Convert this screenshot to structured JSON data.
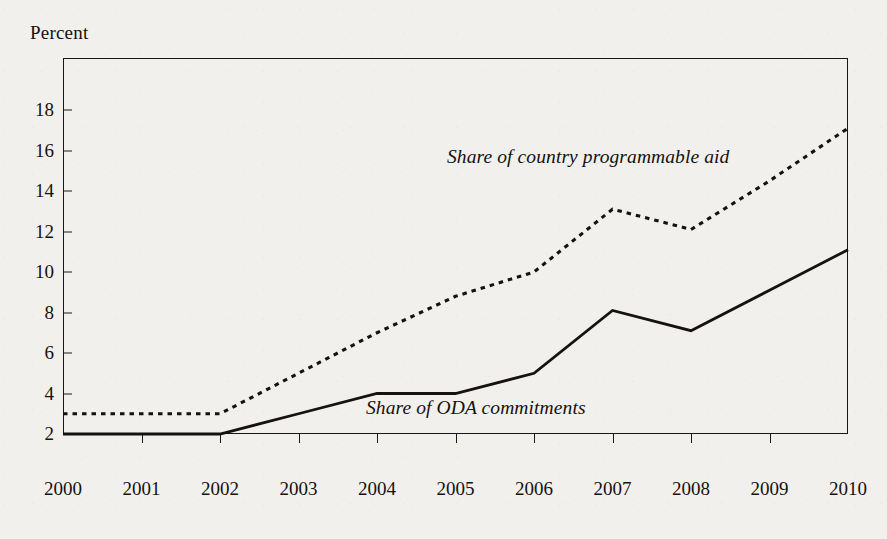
{
  "chart_data": {
    "type": "line",
    "title": "",
    "xlabel": "",
    "ylabel": "Percent",
    "ylim": [
      0,
      19.6
    ],
    "xlim": [
      2000,
      2010
    ],
    "grid": false,
    "legend_position": "inline-annotation",
    "x": [
      2000,
      2001,
      2002,
      2003,
      2004,
      2005,
      2006,
      2007,
      2008,
      2009,
      2010
    ],
    "categories": [
      "2000",
      "2001",
      "2002",
      "2003",
      "2004",
      "2005",
      "2006",
      "2007",
      "2008",
      "2009",
      "2010"
    ],
    "yticks": [
      2,
      4,
      6,
      8,
      10,
      12,
      14,
      16,
      18
    ],
    "ytick_labels": [
      "2",
      "4",
      "6",
      "8",
      "10",
      "12",
      "14",
      "16",
      "18"
    ],
    "series": [
      {
        "name": "Share of country programmable aid",
        "style": "dotted",
        "color": "#15120f",
        "values": [
          3.0,
          3.0,
          3.0,
          5.0,
          7.0,
          8.8,
          10.0,
          13.1,
          12.1,
          14.5,
          17.1
        ]
      },
      {
        "name": "Share of ODA commitments",
        "style": "solid",
        "color": "#15120f",
        "values": [
          2.0,
          2.0,
          2.0,
          3.0,
          4.0,
          4.0,
          5.0,
          8.1,
          7.1,
          9.1,
          11.1
        ]
      }
    ],
    "annotations": [
      {
        "id": "cpa",
        "text": "Share of country programmable aid"
      },
      {
        "id": "oda",
        "text": "Share of ODA commitments"
      }
    ]
  },
  "axis": {
    "unit_label": "Percent"
  },
  "colors": {
    "ink": "#15120f",
    "frame": "#18161a",
    "paper": "#f2f0ed"
  }
}
